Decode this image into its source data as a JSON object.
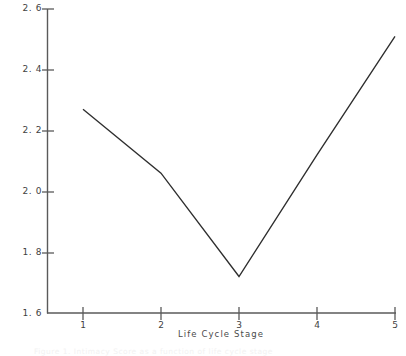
{
  "chart_data": {
    "type": "line",
    "title": "",
    "xlabel": "Life Cycle Stage",
    "ylabel": "Intimacy Score",
    "x": [
      1,
      2,
      3,
      4,
      5
    ],
    "values": [
      2.27,
      2.06,
      1.72,
      2.12,
      2.51
    ],
    "categories": [
      "1",
      "2",
      "3",
      "4",
      "5"
    ],
    "xlim": [
      0.7,
      5.0
    ],
    "ylim": [
      1.6,
      2.6
    ],
    "xticks": [
      "1",
      "2",
      "3",
      "4",
      "5"
    ],
    "yticks": [
      "2. 6",
      "2. 4",
      "2. 2",
      "2. 0",
      "1. 8",
      "1. 6"
    ],
    "ytick_values": [
      2.6,
      2.4,
      2.2,
      2.0,
      1.8,
      1.6
    ],
    "grid": false,
    "legend": false,
    "legend_position": "none",
    "line_color": "#2e2e2e",
    "axis_color": "#555555",
    "background": "#ffffff",
    "series": [
      {
        "name": "Intimacy Score",
        "values": [
          2.27,
          2.06,
          1.72,
          2.12,
          2.51
        ]
      }
    ],
    "annotations": []
  },
  "caption": {
    "text": "Figure 1.  Intimacy Score as a function of life cycle stage"
  }
}
